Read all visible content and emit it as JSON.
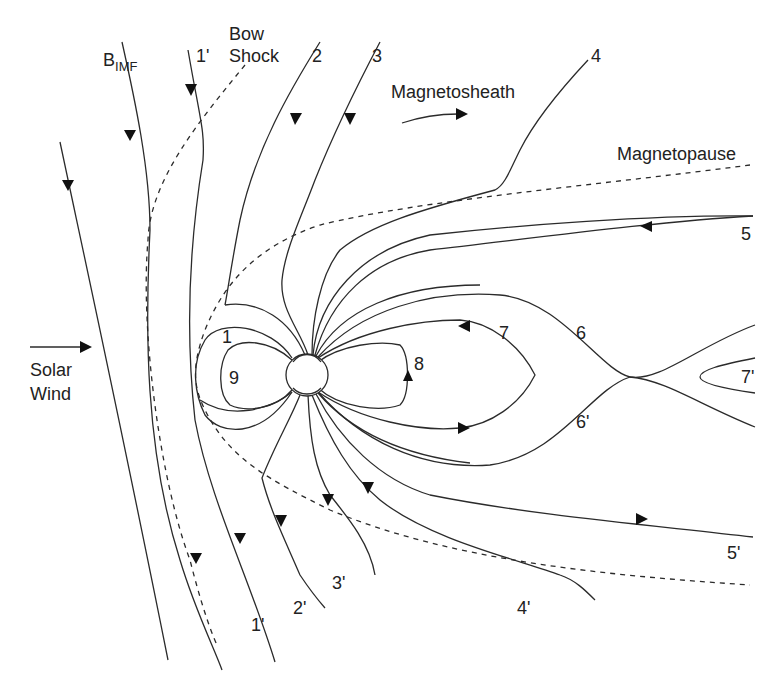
{
  "diagram": {
    "labels": {
      "bimf_main": "B",
      "bimf_sub": "IMF",
      "bow_shock_1": "Bow",
      "bow_shock_2": "Shock",
      "magnetosheath": "Magnetosheath",
      "magnetopause": "Magnetopause",
      "solar_wind_1": "Solar",
      "solar_wind_2": "Wind"
    },
    "field_line_labels": {
      "l1p_top": "1'",
      "l2": "2",
      "l3": "3",
      "l4": "4",
      "l5": "5",
      "l1": "1",
      "l9": "9",
      "l8": "8",
      "l7": "7",
      "l6": "6",
      "l6p": "6'",
      "l7p": "7'",
      "l5p": "5'",
      "l4p": "4'",
      "l3p": "3'",
      "l2p": "2'",
      "l1p_bottom": "1'"
    },
    "colors": {
      "line": "#2b2b2b",
      "background": "#ffffff"
    }
  }
}
